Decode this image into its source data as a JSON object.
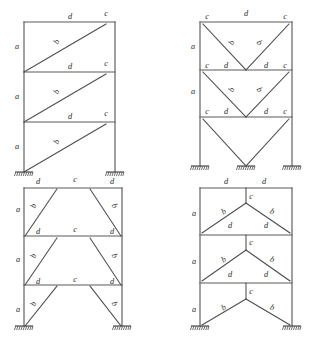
{
  "figure": {
    "background_color": "#ffffff",
    "member_color": "#5a5a5a",
    "label_color": "#2a2a2a",
    "label_style": "italic-serif",
    "panel_count": 4,
    "story_count": 3,
    "support_type": "fixed",
    "labels_used": [
      "a",
      "b",
      "c",
      "d"
    ]
  },
  "panels": [
    {
      "id": "panel-top-left",
      "name": "single-diagonal-braced-frame",
      "position": "top-left",
      "bracing": "single diagonal per story, all sloping up to the right",
      "supports": 2,
      "labels": [
        {
          "text": "d",
          "x": 70,
          "y": 17,
          "rot": 0
        },
        {
          "text": "c",
          "x": 106,
          "y": 14,
          "rot": 0
        },
        {
          "text": "a",
          "x": 17,
          "y": 47,
          "rot": 0
        },
        {
          "text": "b",
          "x": 57,
          "y": 42,
          "rot": -62
        },
        {
          "text": "d",
          "x": 70,
          "y": 67,
          "rot": 0
        },
        {
          "text": "c",
          "x": 106,
          "y": 64,
          "rot": 0
        },
        {
          "text": "a",
          "x": 17,
          "y": 97,
          "rot": 0
        },
        {
          "text": "b",
          "x": 57,
          "y": 92,
          "rot": -62
        },
        {
          "text": "d",
          "x": 70,
          "y": 117,
          "rot": 0
        },
        {
          "text": "c",
          "x": 106,
          "y": 114,
          "rot": 0
        },
        {
          "text": "a",
          "x": 17,
          "y": 147,
          "rot": 0
        },
        {
          "text": "b",
          "x": 57,
          "y": 142,
          "rot": -62
        }
      ]
    },
    {
      "id": "panel-top-right",
      "name": "v-braced-frame",
      "position": "top-right",
      "bracing": "inverted chevron (V) bracing per story",
      "supports": 3,
      "labels": [
        {
          "text": "c",
          "x": 207,
          "y": 17,
          "rot": 0
        },
        {
          "text": "d",
          "x": 246,
          "y": 14,
          "rot": 0
        },
        {
          "text": "c",
          "x": 285,
          "y": 17,
          "rot": 0
        },
        {
          "text": "a",
          "x": 193,
          "y": 47,
          "rot": 0
        },
        {
          "text": "b",
          "x": 232,
          "y": 43,
          "rot": -62
        },
        {
          "text": "b",
          "x": 259,
          "y": 43,
          "rot": 62
        },
        {
          "text": "c",
          "x": 207,
          "y": 66,
          "rot": 0
        },
        {
          "text": "d",
          "x": 226,
          "y": 66,
          "rot": 0
        },
        {
          "text": "d",
          "x": 266,
          "y": 66,
          "rot": 0
        },
        {
          "text": "c",
          "x": 285,
          "y": 66,
          "rot": 0
        },
        {
          "text": "a",
          "x": 193,
          "y": 92,
          "rot": 0
        },
        {
          "text": "b",
          "x": 232,
          "y": 90,
          "rot": -62
        },
        {
          "text": "b",
          "x": 259,
          "y": 90,
          "rot": 62
        },
        {
          "text": "c",
          "x": 207,
          "y": 112,
          "rot": 0
        },
        {
          "text": "d",
          "x": 226,
          "y": 112,
          "rot": 0
        },
        {
          "text": "d",
          "x": 266,
          "y": 112,
          "rot": 0
        },
        {
          "text": "c",
          "x": 285,
          "y": 112,
          "rot": 0
        }
      ]
    },
    {
      "id": "panel-bottom-left",
      "name": "trapezoid-knee-braced-frame",
      "position": "bottom-left",
      "bracing": "pair of inward-sloping diagonals per story forming trapezoid",
      "supports": 2,
      "labels": [
        {
          "text": "d",
          "x": 38,
          "y": 182,
          "rot": 0
        },
        {
          "text": "c",
          "x": 75,
          "y": 180,
          "rot": 0
        },
        {
          "text": "d",
          "x": 112,
          "y": 182,
          "rot": 0
        },
        {
          "text": "a",
          "x": 18,
          "y": 210,
          "rot": 0
        },
        {
          "text": "b",
          "x": 34,
          "y": 206,
          "rot": -68
        },
        {
          "text": "b",
          "x": 114,
          "y": 206,
          "rot": 68
        },
        {
          "text": "d",
          "x": 38,
          "y": 232,
          "rot": 0
        },
        {
          "text": "c",
          "x": 75,
          "y": 230,
          "rot": 0
        },
        {
          "text": "d",
          "x": 112,
          "y": 232,
          "rot": 0
        },
        {
          "text": "a",
          "x": 18,
          "y": 260,
          "rot": 0
        },
        {
          "text": "b",
          "x": 34,
          "y": 256,
          "rot": -68
        },
        {
          "text": "b",
          "x": 114,
          "y": 256,
          "rot": 68
        },
        {
          "text": "d",
          "x": 38,
          "y": 282,
          "rot": 0
        },
        {
          "text": "c",
          "x": 75,
          "y": 280,
          "rot": 0
        },
        {
          "text": "d",
          "x": 112,
          "y": 282,
          "rot": 0
        },
        {
          "text": "a",
          "x": 18,
          "y": 310,
          "rot": 0
        },
        {
          "text": "b",
          "x": 34,
          "y": 304,
          "rot": -68
        },
        {
          "text": "b",
          "x": 114,
          "y": 304,
          "rot": 68
        }
      ]
    },
    {
      "id": "panel-bottom-right",
      "name": "inverted-v-braced-frame",
      "position": "bottom-right",
      "bracing": "chevron (inverted V) bracing with apex post per story",
      "supports": 2,
      "labels": [
        {
          "text": "d",
          "x": 226,
          "y": 182,
          "rot": 0
        },
        {
          "text": "d",
          "x": 264,
          "y": 182,
          "rot": 0
        },
        {
          "text": "c",
          "x": 251,
          "y": 197,
          "rot": 0
        },
        {
          "text": "a",
          "x": 194,
          "y": 214,
          "rot": 0
        },
        {
          "text": "b",
          "x": 224,
          "y": 212,
          "rot": -28
        },
        {
          "text": "b",
          "x": 272,
          "y": 212,
          "rot": 28
        },
        {
          "text": "d",
          "x": 230,
          "y": 226,
          "rot": 0
        },
        {
          "text": "d",
          "x": 266,
          "y": 226,
          "rot": 0
        },
        {
          "text": "c",
          "x": 251,
          "y": 243,
          "rot": 0
        },
        {
          "text": "a",
          "x": 194,
          "y": 262,
          "rot": 0
        },
        {
          "text": "b",
          "x": 224,
          "y": 260,
          "rot": -28
        },
        {
          "text": "b",
          "x": 272,
          "y": 260,
          "rot": 28
        },
        {
          "text": "d",
          "x": 230,
          "y": 275,
          "rot": 0
        },
        {
          "text": "d",
          "x": 266,
          "y": 275,
          "rot": 0
        },
        {
          "text": "c",
          "x": 251,
          "y": 292,
          "rot": 0
        },
        {
          "text": "a",
          "x": 194,
          "y": 310,
          "rot": 0
        },
        {
          "text": "b",
          "x": 224,
          "y": 308,
          "rot": -28
        },
        {
          "text": "b",
          "x": 272,
          "y": 308,
          "rot": 28
        }
      ]
    }
  ],
  "geometry": {
    "panel_top_left": {
      "x_left": 24,
      "x_right": 115,
      "y_top": 22,
      "y_mid1": 72,
      "y_mid2": 122,
      "y_base": 172
    },
    "panel_top_right": {
      "x_left": 200,
      "x_right": 292,
      "x_mid": 246,
      "y_top": 22,
      "y_mid1": 70,
      "y_mid2": 117,
      "y_base": 166
    },
    "panel_bottom_left": {
      "x_left": 24,
      "x_right": 122,
      "y_top": 188,
      "y_mid1": 236,
      "y_mid2": 285,
      "y_base": 326
    },
    "panel_bottom_right": {
      "x_left": 200,
      "x_right": 292,
      "x_mid": 246,
      "y_top": 188,
      "y_mid1": 235,
      "y_mid2": 283,
      "y_base": 326
    }
  }
}
